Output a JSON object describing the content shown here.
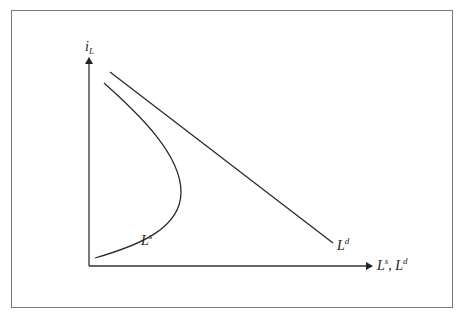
{
  "diagram": {
    "title": "",
    "y_axis": {
      "label": "i",
      "subscript": "L"
    },
    "x_axis": {
      "label_parts": [
        "L",
        "s",
        ", ",
        "L",
        "d"
      ]
    },
    "curves": [
      {
        "name": "Ls",
        "label": "L",
        "superscript": "s",
        "shape": "backward-bending supply curve"
      },
      {
        "name": "Ld",
        "label": "L",
        "superscript": "d",
        "shape": "downward sloping straight line"
      }
    ],
    "colors": {
      "line": "#2a2a2a",
      "frame": "#7a7a7a",
      "background": "#ffffff"
    }
  }
}
